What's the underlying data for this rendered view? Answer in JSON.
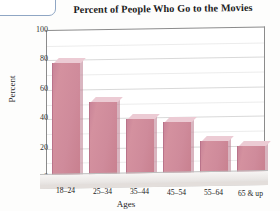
{
  "chart_data": {
    "type": "bar",
    "title": "Percent of People Who Go to the Movies",
    "xlabel": "Ages",
    "ylabel": "Percent",
    "categories": [
      "18–24",
      "25–34",
      "35–44",
      "45–54",
      "55–64",
      "65 & up"
    ],
    "values": [
      78,
      52,
      40,
      38,
      25,
      22
    ],
    "ylim": [
      0,
      100
    ],
    "yticks": [
      0,
      20,
      40,
      60,
      80,
      100
    ],
    "ytick_labels": [
      "0",
      "20",
      "40",
      "60",
      "80",
      "100"
    ],
    "grid": true,
    "grid_interval": 10,
    "legend": null,
    "style": "3d-bar",
    "bar_color": "#cf8b9b",
    "bar_top_color": "#eccbd4",
    "bar_side_color": "#b9788c",
    "frame_color": "#8b8b8b",
    "gridline_color": "#d9d9d9",
    "background": "#ffffff"
  }
}
